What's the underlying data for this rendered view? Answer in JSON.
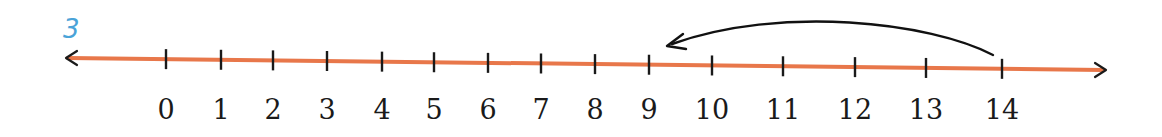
{
  "problem_number": "3",
  "number_line": {
    "start": 0,
    "end": 14,
    "line_color": "#e8774a",
    "tick_color": "#1a1a1a",
    "ticks": [
      {
        "value": 0,
        "label": "0",
        "x": 166
      },
      {
        "value": 1,
        "label": "1",
        "x": 221
      },
      {
        "value": 2,
        "label": "2",
        "x": 273
      },
      {
        "value": 3,
        "label": "3",
        "x": 327
      },
      {
        "value": 4,
        "label": "4",
        "x": 382
      },
      {
        "value": 5,
        "label": "5",
        "x": 434
      },
      {
        "value": 6,
        "label": "6",
        "x": 488
      },
      {
        "value": 7,
        "label": "7",
        "x": 541
      },
      {
        "value": 8,
        "label": "8",
        "x": 595
      },
      {
        "value": 9,
        "label": "9",
        "x": 649
      },
      {
        "value": 10,
        "label": "10",
        "x": 712
      },
      {
        "value": 11,
        "label": "11",
        "x": 783
      },
      {
        "value": 12,
        "label": "12",
        "x": 855
      },
      {
        "value": 13,
        "label": "13",
        "x": 926
      },
      {
        "value": 14,
        "label": "14",
        "x": 1002
      }
    ]
  },
  "jump_arrow": {
    "from": 14,
    "to": 9,
    "direction": "left",
    "color": "#111111"
  }
}
